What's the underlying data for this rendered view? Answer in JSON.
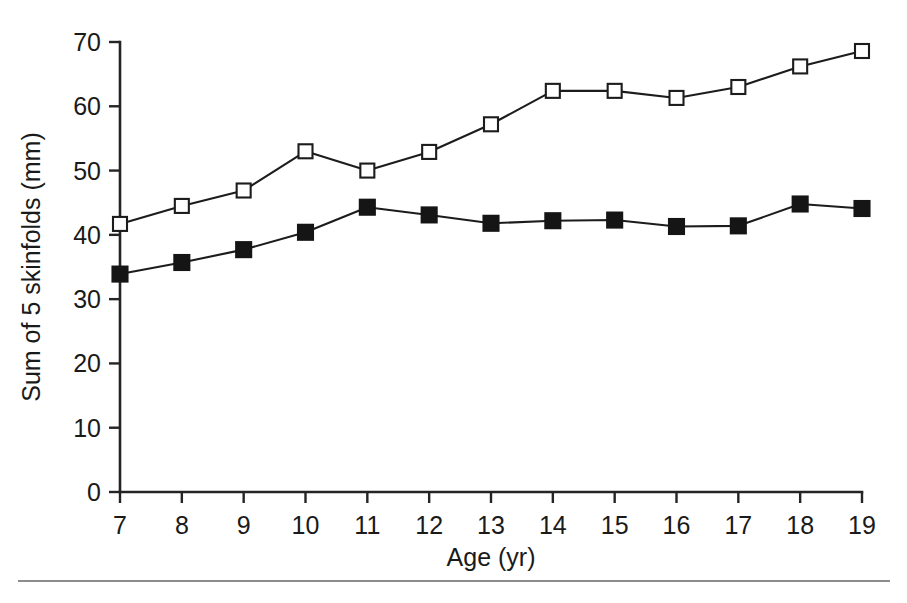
{
  "figure": {
    "background_color": "#ffffff",
    "line_color": "#1c1c1c",
    "axis_color": "#242424",
    "footer_rule_color": "#8c8c8c"
  },
  "chart_data": {
    "type": "line",
    "title": "",
    "subtitle": "",
    "xlabel": "Age (yr)",
    "ylabel": "Sum of 5 skinfolds (mm)",
    "x": [
      7,
      8,
      9,
      10,
      11,
      12,
      13,
      14,
      15,
      16,
      17,
      18,
      19
    ],
    "categories": [
      "7",
      "8",
      "9",
      "10",
      "11",
      "12",
      "13",
      "14",
      "15",
      "16",
      "17",
      "18",
      "19"
    ],
    "xlim": [
      7,
      19
    ],
    "ylim": [
      0,
      70
    ],
    "xticks": [
      7,
      8,
      9,
      10,
      11,
      12,
      13,
      14,
      15,
      16,
      17,
      18,
      19
    ],
    "yticks": [
      0,
      10,
      20,
      30,
      40,
      50,
      60,
      70
    ],
    "xtick_labels": [
      "7",
      "8",
      "9",
      "10",
      "11",
      "12",
      "13",
      "14",
      "15",
      "16",
      "17",
      "18",
      "19"
    ],
    "ytick_labels": [
      "0",
      "10",
      "20",
      "30",
      "40",
      "50",
      "60",
      "70"
    ],
    "grid": false,
    "legend": false,
    "legend_position": "none",
    "series": [
      {
        "name": "open-square-series",
        "marker": "open-square",
        "marker_fill": "#ffffff",
        "marker_edge": "#1c1c1c",
        "line_color": "#1c1c1c",
        "values": [
          41.7,
          44.5,
          46.9,
          53.0,
          50.0,
          52.9,
          57.2,
          62.4,
          62.4,
          61.3,
          63.0,
          66.2,
          68.6
        ]
      },
      {
        "name": "filled-square-series",
        "marker": "filled-square",
        "marker_fill": "#151515",
        "marker_edge": "#151515",
        "line_color": "#1c1c1c",
        "values": [
          33.9,
          35.7,
          37.7,
          40.4,
          44.3,
          43.1,
          41.8,
          42.2,
          42.3,
          41.3,
          41.4,
          44.8,
          44.1
        ]
      }
    ]
  }
}
